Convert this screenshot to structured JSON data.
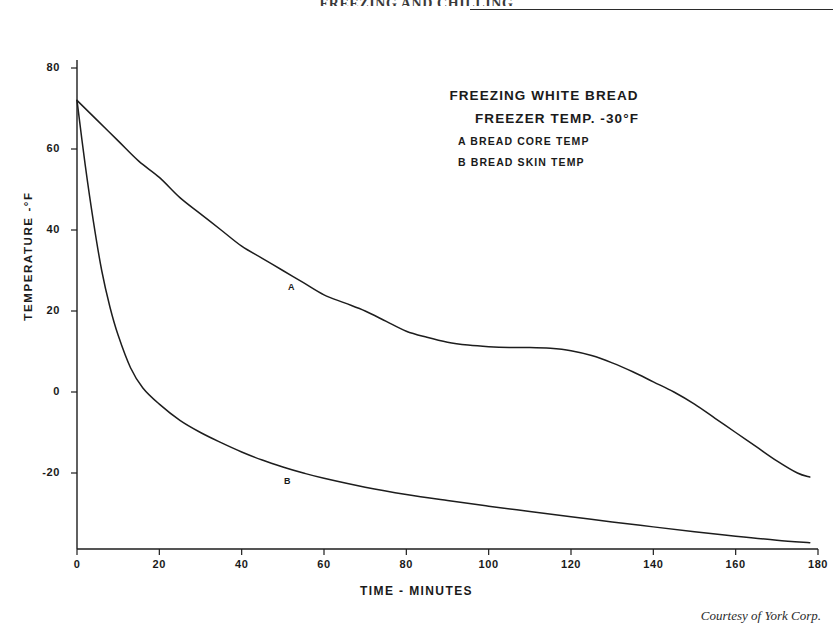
{
  "page": {
    "running_header": "FREEZING AND CHILLING",
    "credit": "Courtesy of York Corp."
  },
  "legend": {
    "line1": "FREEZING WHITE BREAD",
    "line2": "FREEZER TEMP. -30°F",
    "line3": "A BREAD CORE TEMP",
    "line4": "B BREAD SKIN  TEMP",
    "tag_a": "A",
    "tag_b": "B"
  },
  "chart_data": {
    "type": "line",
    "title": "FREEZING WHITE BREAD",
    "subtitle": "FREEZER TEMP. -30°F",
    "xlabel": "TIME - MINUTES",
    "ylabel": "TEMPERATURE -°F",
    "xlim": [
      0,
      180
    ],
    "ylim": [
      -45,
      85
    ],
    "xticks": [
      0,
      20,
      40,
      60,
      80,
      100,
      120,
      140,
      160,
      180
    ],
    "xtick_labels": [
      "0",
      "20",
      "40",
      "60",
      "80",
      "100",
      "120",
      "140",
      "160",
      "180"
    ],
    "yticks": [
      80,
      60,
      40,
      20,
      0,
      -20
    ],
    "ytick_labels": [
      "80",
      "60",
      "40",
      "20",
      "0",
      "-20"
    ],
    "grid": false,
    "legend_position": "upper-right-inside",
    "line_color": "#1d1d1d",
    "series": [
      {
        "name": "A BREAD CORE TEMP",
        "label": "A",
        "label_at": {
          "x": 52,
          "y": 26
        },
        "x": [
          0,
          5,
          10,
          15,
          20,
          25,
          30,
          35,
          40,
          45,
          50,
          55,
          60,
          65,
          70,
          75,
          80,
          85,
          90,
          95,
          100,
          105,
          110,
          115,
          120,
          125,
          130,
          135,
          140,
          145,
          150,
          155,
          160,
          165,
          170,
          175,
          178
        ],
        "values": [
          72,
          67,
          62,
          57,
          53,
          48,
          44,
          40,
          36,
          33,
          30,
          27,
          24,
          22,
          20,
          17.5,
          15,
          13.5,
          12.3,
          11.6,
          11.2,
          11.0,
          11.0,
          10.8,
          10.2,
          9.0,
          7.2,
          5.0,
          2.5,
          0.0,
          -3.0,
          -6.5,
          -10.0,
          -13.5,
          -17.0,
          -20.0,
          -21.0
        ]
      },
      {
        "name": "B BREAD SKIN TEMP",
        "label": "B",
        "label_at": {
          "x": 51,
          "y": -22
        },
        "x": [
          0,
          2,
          4,
          6,
          8,
          10,
          13,
          16,
          20,
          25,
          30,
          35,
          40,
          45,
          50,
          55,
          60,
          70,
          80,
          90,
          100,
          110,
          120,
          130,
          140,
          150,
          160,
          170,
          178
        ],
        "values": [
          72,
          56,
          42,
          30,
          21,
          14,
          6,
          1,
          -3,
          -7,
          -10,
          -12.5,
          -14.8,
          -16.8,
          -18.5,
          -20.0,
          -21.3,
          -23.5,
          -25.3,
          -26.8,
          -28.2,
          -29.5,
          -30.8,
          -32.1,
          -33.3,
          -34.5,
          -35.6,
          -36.6,
          -37.2
        ]
      }
    ]
  }
}
